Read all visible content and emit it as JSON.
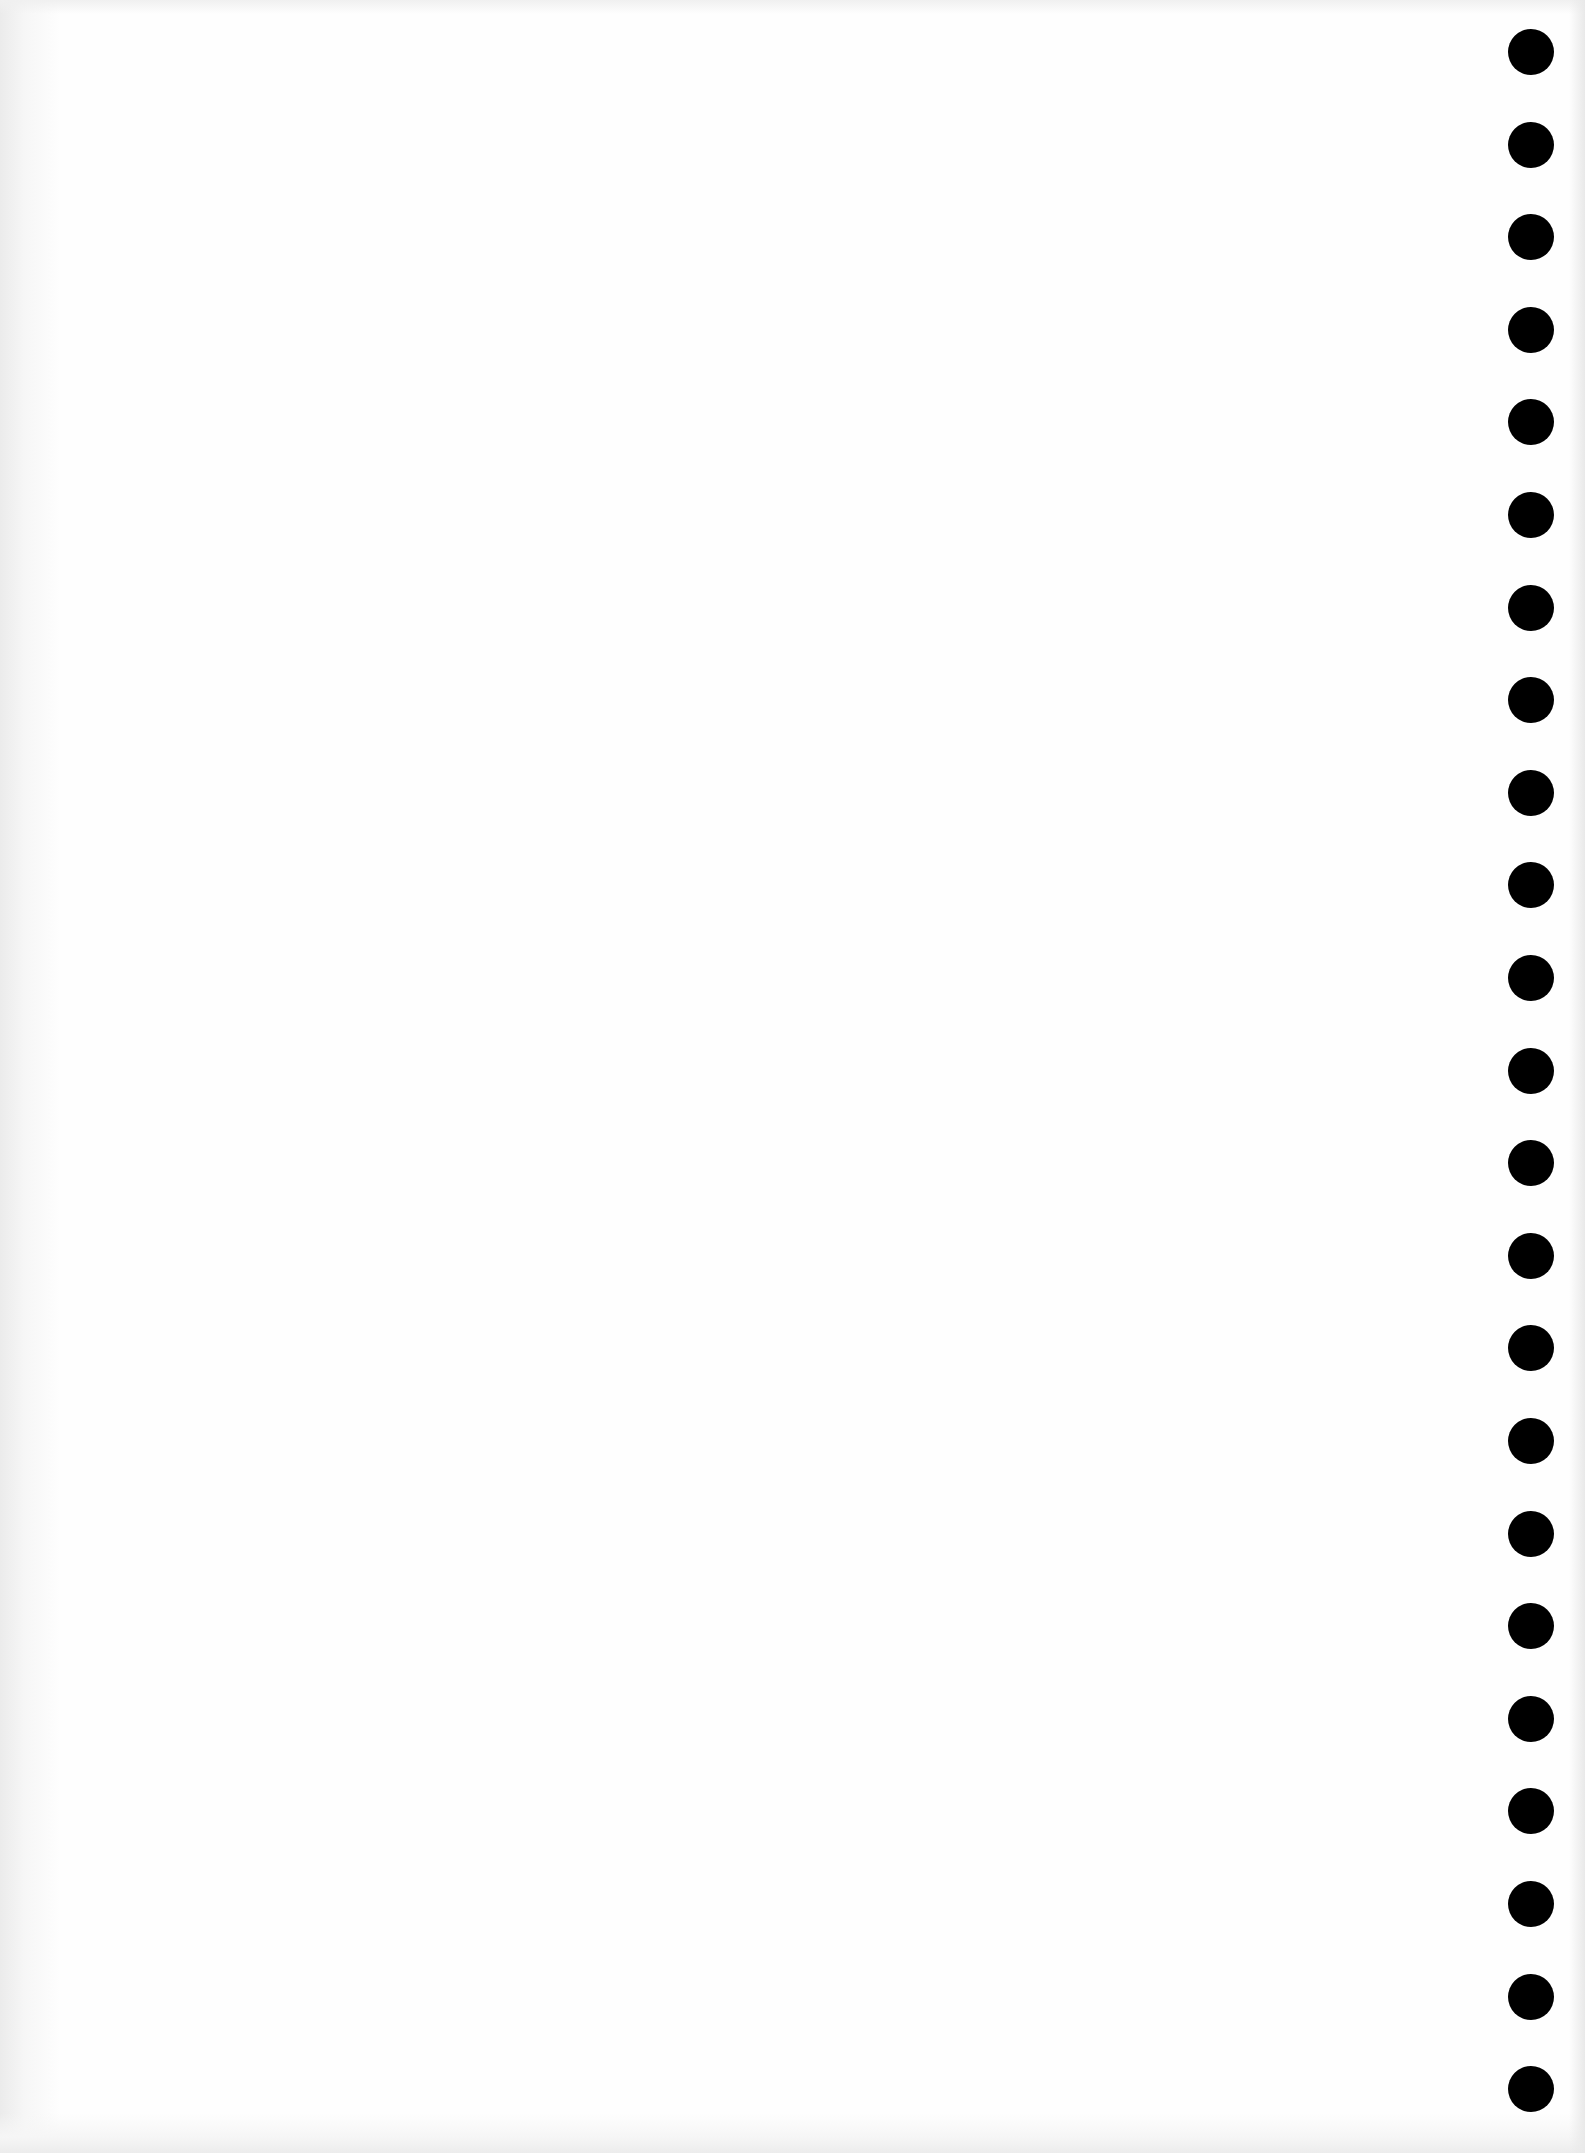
{
  "document": {
    "type": "blank-scanned-page",
    "text": "",
    "binding": {
      "hole_count": 23,
      "hole_color": "#000000",
      "side": "right"
    },
    "paper_color": "#fefefe"
  }
}
